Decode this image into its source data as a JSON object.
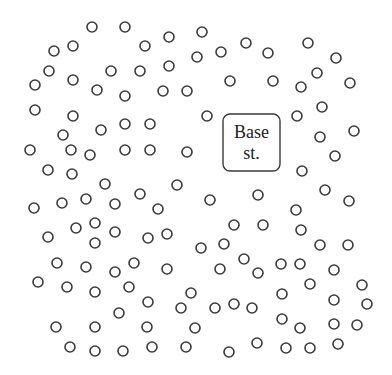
{
  "diagram": {
    "title": "",
    "base_station": {
      "label_line1": "Base",
      "label_line2": "st.",
      "box": {
        "x": 223,
        "y": 114,
        "w": 57,
        "h": 57,
        "rx": 7
      }
    },
    "node_radius": 5,
    "node_color": "#3a3a3a",
    "nodes": [
      [
        92,
        27
      ],
      [
        125,
        27
      ],
      [
        145,
        46
      ],
      [
        169,
        37
      ],
      [
        202,
        32
      ],
      [
        197,
        57
      ],
      [
        221,
        52
      ],
      [
        246,
        43
      ],
      [
        268,
        53
      ],
      [
        308,
        43
      ],
      [
        54,
        51
      ],
      [
        73,
        46
      ],
      [
        49,
        71
      ],
      [
        111,
        71
      ],
      [
        35,
        85
      ],
      [
        73,
        80
      ],
      [
        97,
        90
      ],
      [
        125,
        96
      ],
      [
        140,
        71
      ],
      [
        169,
        66
      ],
      [
        230,
        81
      ],
      [
        163,
        91
      ],
      [
        187,
        91
      ],
      [
        336,
        58
      ],
      [
        317,
        73
      ],
      [
        273,
        81
      ],
      [
        301,
        87
      ],
      [
        350,
        83
      ],
      [
        322,
        107
      ],
      [
        297,
        116
      ],
      [
        35,
        110
      ],
      [
        73,
        116
      ],
      [
        125,
        124
      ],
      [
        150,
        124
      ],
      [
        207,
        116
      ],
      [
        63,
        135
      ],
      [
        101,
        130
      ],
      [
        30,
        150
      ],
      [
        71,
        150
      ],
      [
        90,
        155
      ],
      [
        125,
        150
      ],
      [
        150,
        150
      ],
      [
        187,
        152
      ],
      [
        320,
        137
      ],
      [
        354,
        131
      ],
      [
        48,
        170
      ],
      [
        72,
        174
      ],
      [
        105,
        184
      ],
      [
        177,
        185
      ],
      [
        140,
        194
      ],
      [
        158,
        209
      ],
      [
        210,
        200
      ],
      [
        335,
        156
      ],
      [
        302,
        171
      ],
      [
        325,
        190
      ],
      [
        349,
        201
      ],
      [
        296,
        210
      ],
      [
        258,
        195
      ],
      [
        34,
        208
      ],
      [
        62,
        203
      ],
      [
        86,
        199
      ],
      [
        115,
        204
      ],
      [
        76,
        228
      ],
      [
        95,
        223
      ],
      [
        115,
        232
      ],
      [
        148,
        238
      ],
      [
        167,
        234
      ],
      [
        234,
        225
      ],
      [
        263,
        225
      ],
      [
        301,
        230
      ],
      [
        48,
        237
      ],
      [
        95,
        243
      ],
      [
        201,
        248
      ],
      [
        224,
        244
      ],
      [
        320,
        245
      ],
      [
        348,
        245
      ],
      [
        57,
        263
      ],
      [
        86,
        267
      ],
      [
        115,
        272
      ],
      [
        134,
        263
      ],
      [
        167,
        269
      ],
      [
        220,
        269
      ],
      [
        244,
        259
      ],
      [
        258,
        273
      ],
      [
        281,
        264
      ],
      [
        300,
        264
      ],
      [
        334,
        270
      ],
      [
        38,
        282
      ],
      [
        67,
        287
      ],
      [
        95,
        292
      ],
      [
        129,
        287
      ],
      [
        191,
        293
      ],
      [
        310,
        284
      ],
      [
        362,
        285
      ],
      [
        282,
        294
      ],
      [
        334,
        300
      ],
      [
        119,
        313
      ],
      [
        148,
        302
      ],
      [
        181,
        308
      ],
      [
        215,
        308
      ],
      [
        234,
        304
      ],
      [
        252,
        308
      ],
      [
        367,
        304
      ],
      [
        282,
        319
      ],
      [
        300,
        328
      ],
      [
        334,
        324
      ],
      [
        357,
        325
      ],
      [
        56,
        327
      ],
      [
        95,
        327
      ],
      [
        147,
        327
      ],
      [
        195,
        328
      ],
      [
        70,
        347
      ],
      [
        95,
        351
      ],
      [
        123,
        351
      ],
      [
        152,
        347
      ],
      [
        186,
        347
      ],
      [
        229,
        352
      ],
      [
        257,
        343
      ],
      [
        286,
        348
      ],
      [
        310,
        348
      ],
      [
        338,
        344
      ]
    ]
  }
}
